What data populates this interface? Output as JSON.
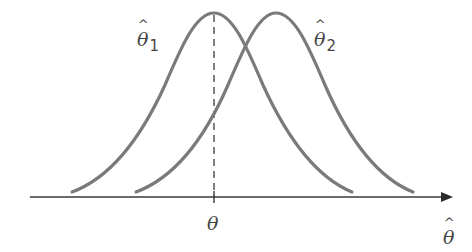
{
  "diagram": {
    "title": "",
    "colors": {
      "curve": "#7a7a7a",
      "axis": "#3a3a3a",
      "text": "#444444",
      "background": "#ffffff"
    },
    "curves": [
      {
        "id": "estimator-1",
        "label_symbol": "θ",
        "label_subscript": "1",
        "has_hat": true,
        "center_x": 214,
        "peak_y": 13,
        "left_end": [
          72,
          192
        ],
        "right_end": [
          352,
          192
        ]
      },
      {
        "id": "estimator-2",
        "label_symbol": "θ",
        "label_subscript": "2",
        "has_hat": true,
        "center_x": 276,
        "peak_y": 13,
        "left_end": [
          136,
          192
        ],
        "right_end": [
          413,
          192
        ]
      }
    ],
    "true_value_marker": {
      "label": "θ",
      "x": 214,
      "style": "dashed"
    },
    "x_axis": {
      "label": "θ",
      "label_has_hat": true,
      "arrow": "right"
    }
  }
}
